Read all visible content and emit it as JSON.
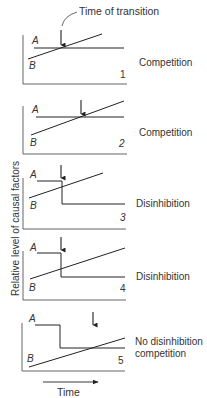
{
  "annotation": {
    "label": "Time of transition"
  },
  "axes": {
    "ylabel": "Relative level of causal factors",
    "xlabel": "Time"
  },
  "series_labels": {
    "a": "A",
    "b": "B"
  },
  "panels": [
    {
      "number": "1",
      "outcome": "Competition"
    },
    {
      "number": "2",
      "outcome": "Competition"
    },
    {
      "number": "3",
      "outcome": "Disinhibition"
    },
    {
      "number": "4",
      "outcome": "Disinhibition"
    },
    {
      "number": "5",
      "outcome_line1": "No disinhibition",
      "outcome_line2": "competition"
    }
  ]
}
